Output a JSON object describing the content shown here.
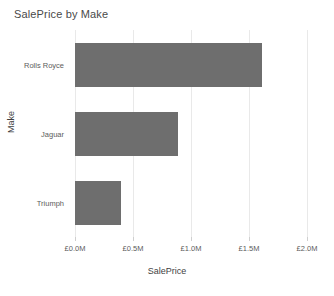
{
  "chart_data": {
    "type": "bar",
    "orientation": "horizontal",
    "title": "SalePrice by Make",
    "xlabel": "SalePrice",
    "ylabel": "Make",
    "categories": [
      "Rolls Royce",
      "Jaguar",
      "Triumph"
    ],
    "values": [
      1.61,
      0.89,
      0.4
    ],
    "value_unit": "GBP millions",
    "xlim": [
      0.0,
      2.0
    ],
    "xticks": [
      0.0,
      0.5,
      1.0,
      1.5,
      2.0
    ],
    "xtick_labels": [
      "£0.0M",
      "£0.5M",
      "£1.0M",
      "£1.5M",
      "£2.0M"
    ],
    "grid": true,
    "grid_axis": "x",
    "legend": false,
    "bar_color": "#6e6e6e",
    "gridline_color": "#e9e9e9",
    "background_color": "#ffffff"
  }
}
